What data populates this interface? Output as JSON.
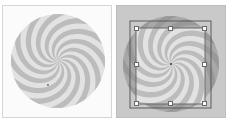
{
  "panels": [
    {
      "id": "original",
      "label": "",
      "background": "#fbfbfb"
    },
    {
      "id": "transformed",
      "label": "",
      "background": "#c9c9c9"
    }
  ],
  "colors": {
    "swirl_light": "#e4e4e4",
    "swirl_dark": "#bcbcbc",
    "frame": "#555555",
    "handle_fill": "#ffffff"
  },
  "swirl": {
    "arms": 12
  }
}
